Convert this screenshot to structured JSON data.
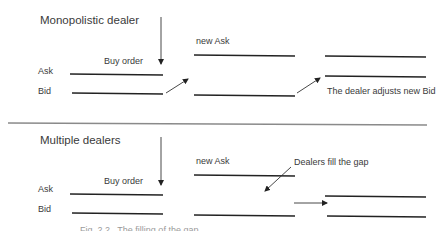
{
  "panels": [
    {
      "title": "Monopolistic dealer",
      "ask_label": "Ask",
      "bid_label": "Bid",
      "order_label": "Buy order",
      "new_ask_label": "new Ask",
      "annotation": "The dealer adjusts new Bid"
    },
    {
      "title": "Multiple dealers",
      "ask_label": "Ask",
      "bid_label": "Bid",
      "order_label": "Buy order",
      "new_ask_label": "new Ask",
      "annotation": "Dealers fill the gap"
    }
  ],
  "caption": "Fig. 2.2   The filling of the gap"
}
